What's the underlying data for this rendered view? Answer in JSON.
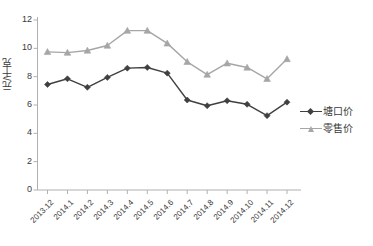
{
  "chart_data": {
    "type": "line",
    "title": "",
    "xlabel": "",
    "ylabel": "元/千克",
    "ylim": [
      0,
      12
    ],
    "yticks": [
      "0",
      "2",
      "4",
      "6",
      "8",
      "10",
      "12"
    ],
    "grid": false,
    "legend_position": "right",
    "categories": [
      "2013.12",
      "2014.1",
      "2014.2",
      "2014.3",
      "2014.4",
      "2014.5",
      "2014.6",
      "2014.7",
      "2014.8",
      "2014.9",
      "2014.10",
      "2014.11",
      "2014.12"
    ],
    "series": [
      {
        "name": "塘口价",
        "color": "#404040",
        "marker": "diamond",
        "values": [
          7.45,
          7.85,
          7.25,
          7.95,
          8.6,
          8.65,
          8.25,
          6.35,
          5.95,
          6.3,
          6.05,
          5.25,
          6.2
        ]
      },
      {
        "name": "零售价",
        "color": "#a6a6a6",
        "marker": "triangle",
        "values": [
          9.75,
          9.7,
          9.85,
          10.2,
          11.25,
          11.25,
          10.35,
          9.05,
          8.15,
          8.95,
          8.65,
          7.85,
          9.25
        ]
      }
    ]
  },
  "axis": {
    "line_color": "#b0b0b0",
    "tick_color": "#b0b0b0"
  }
}
